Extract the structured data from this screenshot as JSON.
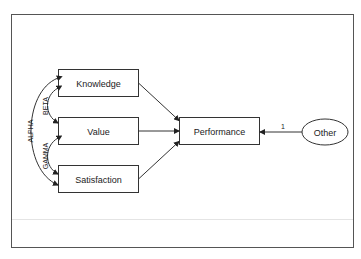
{
  "diagram": {
    "type": "path-diagram",
    "nodes": [
      {
        "id": "knowledge",
        "label": "Knowledge",
        "shape": "rectangle",
        "kind": "observed"
      },
      {
        "id": "value",
        "label": "Value",
        "shape": "rectangle",
        "kind": "observed"
      },
      {
        "id": "satisfaction",
        "label": "Satisfaction",
        "shape": "rectangle",
        "kind": "observed"
      },
      {
        "id": "performance",
        "label": "Performance",
        "shape": "rectangle",
        "kind": "observed"
      },
      {
        "id": "other",
        "label": "Other",
        "shape": "ellipse",
        "kind": "unobserved"
      }
    ],
    "edges": [
      {
        "from": "knowledge",
        "to": "performance",
        "type": "single-arrow"
      },
      {
        "from": "value",
        "to": "performance",
        "type": "single-arrow"
      },
      {
        "from": "satisfaction",
        "to": "performance",
        "type": "single-arrow"
      },
      {
        "from": "other",
        "to": "performance",
        "type": "single-arrow",
        "label": "1"
      }
    ],
    "covariances": [
      {
        "between": [
          "knowledge",
          "satisfaction"
        ],
        "label": "ALPHA"
      },
      {
        "between": [
          "knowledge",
          "value"
        ],
        "label": "BETA"
      },
      {
        "between": [
          "value",
          "satisfaction"
        ],
        "label": "GAMMA"
      }
    ]
  },
  "labels": {
    "knowledge": "Knowledge",
    "value": "Value",
    "satisfaction": "Satisfaction",
    "performance": "Performance",
    "other": "Other",
    "alpha": "ALPHA",
    "beta": "BETA",
    "gamma": "GAMMA",
    "other_path": "1"
  },
  "colors": {
    "stroke": "#333333",
    "background": "#ffffff",
    "frame": "#555555"
  }
}
